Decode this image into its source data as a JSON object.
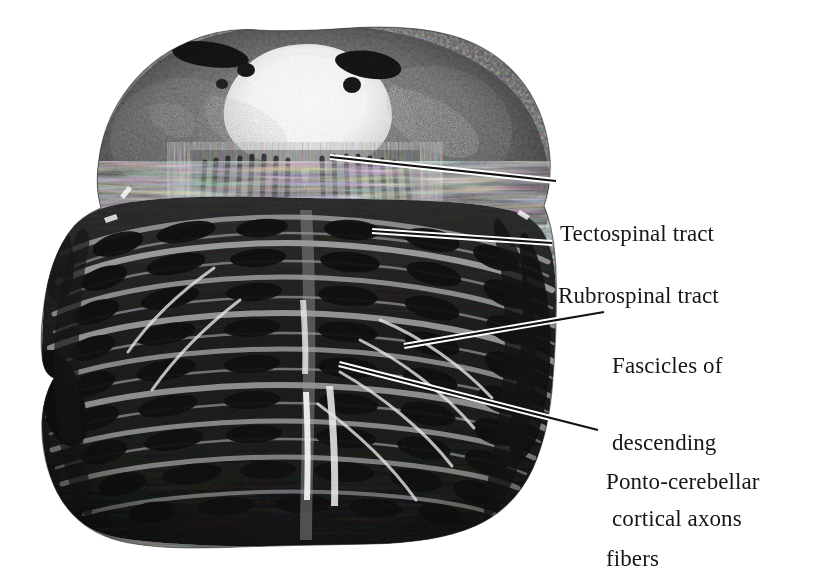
{
  "figure": {
    "kind": "histological-section",
    "background_color": "#ffffff",
    "ink_color": "#16171a"
  },
  "labels": [
    {
      "id": "tectospinal",
      "name": "label-tectospinal-tract",
      "lines": [
        "Tectospinal tract"
      ],
      "x": 560,
      "y": 170
    },
    {
      "id": "rubrospinal",
      "name": "label-rubrospinal-tract",
      "lines": [
        "Rubrospinal tract"
      ],
      "x": 558,
      "y": 232
    },
    {
      "id": "fascicles",
      "name": "label-fascicles-of-descending-cortical-axons",
      "lines": [
        "Fascicles of",
        "descending",
        "cortical axons"
      ],
      "x": 612,
      "y": 302
    },
    {
      "id": "ponto",
      "name": "label-ponto-cerebellar-fibers",
      "lines": [
        "Ponto-cerebellar",
        "fibers"
      ],
      "x": 606,
      "y": 418
    }
  ],
  "label_text": {
    "tectospinal_l1": "Tectospinal tract",
    "rubrospinal_l1": "Rubrospinal tract",
    "fascicles_l1": "Fascicles of",
    "fascicles_l2": "descending",
    "fascicles_l3": "cortical axons",
    "ponto_l1": "Ponto-cerebellar",
    "ponto_l2": "fibers"
  },
  "leader_lines": [
    {
      "id": "leader-tectospinal",
      "from": [
        330,
        157
      ],
      "to": [
        556,
        181
      ]
    },
    {
      "id": "leader-rubrospinal",
      "from": [
        372,
        231
      ],
      "to": [
        552,
        243
      ]
    },
    {
      "id": "leader-fascicles",
      "from": [
        404,
        346
      ],
      "to": [
        604,
        312
      ]
    },
    {
      "id": "leader-ponto",
      "from": [
        339,
        364
      ],
      "to": [
        598,
        430
      ]
    }
  ],
  "specimen": {
    "outline_description": "Rounded pontine cross-section, wide basilar base, tapering dorsal tegmentum with fourth ventricle notch at top midline",
    "bounds": {
      "left": 40,
      "top": 28,
      "right": 565,
      "bottom": 548
    },
    "features": [
      {
        "name": "fourth-ventricle",
        "tone": "#ffffff"
      },
      {
        "name": "superior-cerebellar-peduncle-left",
        "tone": "#101010"
      },
      {
        "name": "superior-cerebellar-peduncle-right",
        "tone": "#101010"
      },
      {
        "name": "tegmentum",
        "tone": "#6e6e6e"
      },
      {
        "name": "basilar-pons",
        "tone": "#171717"
      },
      {
        "name": "median-raphe",
        "tone": "#d8d8d8"
      },
      {
        "name": "transverse-pontine-fibers",
        "tone": "#cfcfcf"
      },
      {
        "name": "middle-cerebellar-peduncle-left",
        "tone": "#0d0d0d"
      },
      {
        "name": "middle-cerebellar-peduncle-right",
        "tone": "#0d0d0d"
      }
    ]
  }
}
